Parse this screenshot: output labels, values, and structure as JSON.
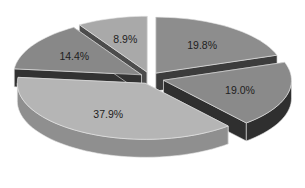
{
  "chart_data": {
    "type": "pie",
    "style": "3d-exploded",
    "title": "",
    "categories": [
      "Slice A",
      "Slice B",
      "Slice C",
      "Slice D",
      "Slice E"
    ],
    "values": [
      19.8,
      19.0,
      37.9,
      14.4,
      8.9
    ],
    "labels": [
      "19.8%",
      "19.0%",
      "37.9%",
      "14.4%",
      "8.9%"
    ],
    "start_angle_deg": 0,
    "direction": "clockwise",
    "legend": "none",
    "colors": {
      "top": [
        "#8d8d8d",
        "#8a8a8a",
        "#b5b5b5",
        "#888888",
        "#a9a9a9"
      ],
      "side": [
        "#3c3c3c",
        "#2f2f2f",
        "#8f8f8f",
        "#323232",
        "#4c4c4c"
      ]
    },
    "explode_px": [
      10,
      14,
      10,
      10,
      10
    ]
  }
}
